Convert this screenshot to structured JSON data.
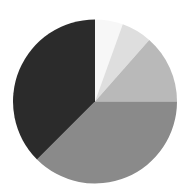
{
  "chart_data": {
    "type": "pie",
    "title": "",
    "legend": [],
    "start_angle_deg": 0,
    "direction": "clockwise",
    "slices": [
      {
        "label": "",
        "value": 5.5,
        "color": "#f7f7f7"
      },
      {
        "label": "",
        "value": 6.0,
        "color": "#dedede"
      },
      {
        "label": "",
        "value": 13.5,
        "color": "#b9b9b9"
      },
      {
        "label": "",
        "value": 37.5,
        "color": "#8a8a8a"
      },
      {
        "label": "",
        "value": 37.5,
        "color": "#2b2b2b"
      }
    ],
    "values": [
      5.5,
      6.0,
      13.5,
      37.5,
      37.5
    ],
    "categories": [
      "",
      "",
      "",
      "",
      ""
    ]
  },
  "layout": {
    "cx": 95,
    "cy": 101.5,
    "r": 82
  }
}
